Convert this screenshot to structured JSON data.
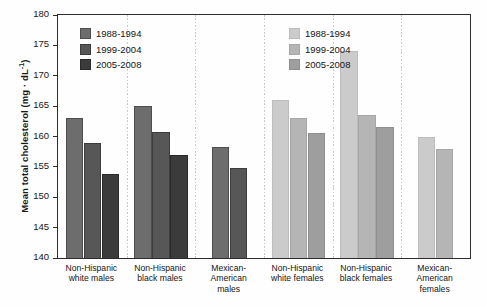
{
  "chart_data": {
    "type": "bar",
    "title": "",
    "xlabel": "",
    "ylabel": "Mean total cholesterol (mg·dL⁻¹)",
    "ylabel_main": "Mean total cholesterol (mg · dL",
    "ylabel_exp": "-1",
    "ylabel_close": ")",
    "ylim": [
      140,
      180
    ],
    "yticks": [
      140,
      145,
      150,
      155,
      160,
      165,
      170,
      175,
      180
    ],
    "ytick_labels": [
      "140",
      "145",
      "150",
      "155",
      "160",
      "165",
      "170",
      "175",
      "180"
    ],
    "grid": false,
    "legend_position": "inside-top-left and inside-top-right",
    "categories": [
      "Non-Hispanic white males",
      "Non-Hispanic black males",
      "Mexican-American males",
      "Non-Hispanic white females",
      "Non-Hispanic black females",
      "Mexican-American females"
    ],
    "category_lines": [
      [
        "Non-Hispanic",
        "white males"
      ],
      [
        "Non-Hispanic",
        "black males"
      ],
      [
        "Mexican-",
        "American",
        "males"
      ],
      [
        "Non-Hispanic",
        "white females"
      ],
      [
        "Non-Hispanic",
        "black females"
      ],
      [
        "Mexican-",
        "American",
        "females"
      ]
    ],
    "series": [
      {
        "name": "1988-1994",
        "values": [
          163.0,
          165.0,
          158.2,
          166.0,
          174.0,
          160.0
        ]
      },
      {
        "name": "1999-2004",
        "values": [
          159.0,
          160.7,
          154.8,
          163.0,
          163.5,
          158.0
        ]
      },
      {
        "name": "2005-2008",
        "values": [
          153.8,
          157.0,
          null,
          160.6,
          161.5,
          null
        ]
      }
    ]
  },
  "legend_males": {
    "title": "males-legend",
    "items": [
      {
        "label": "1988-1994",
        "color": "#6d6d6d"
      },
      {
        "label": "1999-2004",
        "color": "#575757"
      },
      {
        "label": "2005-2008",
        "color": "#3b3b3b"
      }
    ]
  },
  "legend_females": {
    "title": "females-legend",
    "items": [
      {
        "label": "1988-1994",
        "color": "#cbcbcb"
      },
      {
        "label": "1999-2004",
        "color": "#b5b5b5"
      },
      {
        "label": "2005-2008",
        "color": "#9e9e9e"
      }
    ]
  }
}
